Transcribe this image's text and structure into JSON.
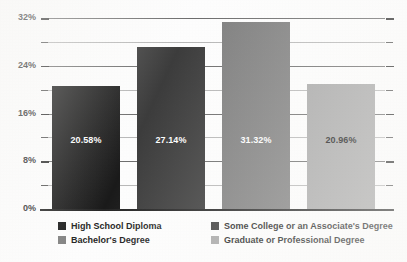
{
  "chart_data": {
    "type": "bar",
    "title": "Education",
    "categories": [
      "High School Diploma",
      "Some College or an Associate's Degree",
      "Bachelor's Degree",
      "Graduate or Professional Degree"
    ],
    "values": [
      20.58,
      27.14,
      31.32,
      20.96
    ],
    "value_labels": [
      "20.58%",
      "27.14%",
      "31.32%",
      "20.96%"
    ],
    "series": [
      {
        "name": "Education",
        "values": [
          20.58,
          27.14,
          31.32,
          20.96
        ]
      }
    ],
    "xlabel": "",
    "ylabel": "",
    "ylim": [
      0,
      32
    ],
    "ytick_labels": [
      "0%",
      "8%",
      "16%",
      "24%",
      "32%"
    ],
    "ytick_values": [
      0,
      8,
      16,
      24,
      32
    ],
    "minor_tick_values": [
      4,
      12,
      20,
      28
    ],
    "grid": true,
    "grid_axis": "y",
    "legend_position": "bottom",
    "bar_colors": [
      "#1a1a1a",
      "#3d3d3d",
      "#808080",
      "#a8a8a8"
    ],
    "value_label_colors": [
      "#ffffff",
      "#ffffff",
      "#ffffff",
      "#141414"
    ]
  },
  "axis": {
    "ticks": [
      {
        "label": "32%",
        "value": 32,
        "major": true
      },
      {
        "label": "",
        "value": 28,
        "major": false
      },
      {
        "label": "24%",
        "value": 24,
        "major": true
      },
      {
        "label": "",
        "value": 20,
        "major": false
      },
      {
        "label": "16%",
        "value": 16,
        "major": true
      },
      {
        "label": "",
        "value": 12,
        "major": false
      },
      {
        "label": "8%",
        "value": 8,
        "major": true
      },
      {
        "label": "",
        "value": 4,
        "major": false
      },
      {
        "label": "0%",
        "value": 0,
        "major": true
      }
    ]
  },
  "bars": [
    {
      "label": "High School Diploma",
      "value_label": "20.58%",
      "color": "#1a1a1a",
      "text_color": "#ffffff"
    },
    {
      "label": "Some College or an Associate's Degree",
      "value_label": "27.14%",
      "color": "#3d3d3d",
      "text_color": "#ffffff"
    },
    {
      "label": "Bachelor's Degree",
      "value_label": "31.32%",
      "color": "#808080",
      "text_color": "#ffffff"
    },
    {
      "label": "Graduate or Professional Degree",
      "value_label": "20.96%",
      "color": "#a8a8a8",
      "text_color": "#141414"
    }
  ],
  "legend": {
    "entries": [
      {
        "label": "High School Diploma",
        "color": "#1a1a1a"
      },
      {
        "label": "Some College or an Associate's Degree",
        "color": "#3d3d3d"
      },
      {
        "label": "Bachelor's Degree",
        "color": "#808080"
      },
      {
        "label": "Graduate or Professional Degree",
        "color": "#a8a8a8"
      }
    ]
  }
}
